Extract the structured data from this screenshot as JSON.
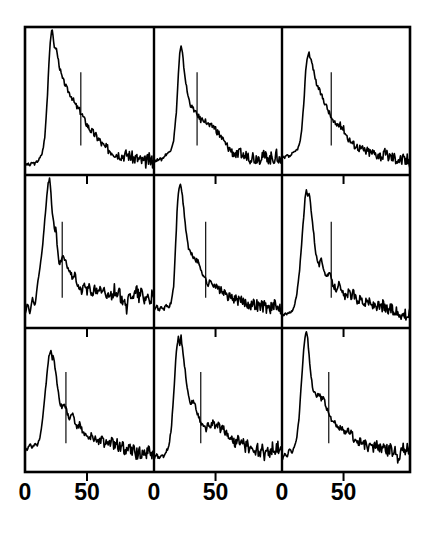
{
  "figure": {
    "title": "",
    "panel_rows": 3,
    "panel_cols": 3,
    "background_color": "#ffffff",
    "line_color": "#000000",
    "frame_color": "#000000",
    "marker_color": "#000000"
  },
  "axis": {
    "x_tick_labels": [
      "0",
      "50"
    ],
    "x_tick_values": [
      0,
      50
    ],
    "x_range": [
      0,
      104
    ],
    "show_y_axis_labels": false,
    "grid": false
  },
  "columns": [
    {
      "tick_labels": [
        "0",
        "50"
      ]
    },
    {
      "tick_labels": [
        "0",
        "50"
      ]
    },
    {
      "tick_labels": [
        "0",
        "50"
      ]
    }
  ],
  "chart_data": {
    "type": "line",
    "title": "",
    "xlabel": "",
    "ylabel": "",
    "xlim": [
      0,
      104
    ],
    "ylim": [
      0,
      1
    ],
    "grid": false,
    "legend": null,
    "layout": {
      "rows": 3,
      "cols": 3,
      "shared_x": true,
      "x_tick_labels": [
        "0",
        "50"
      ],
      "x_ticks": [
        0,
        50
      ]
    },
    "panels": [
      {
        "id": "panel-r1c1",
        "row": 1,
        "col": 1,
        "marker_x": 45,
        "peak_x": 22,
        "peak_y": 1.0,
        "x": [
          0,
          2,
          4,
          6,
          8,
          10,
          12,
          14,
          16,
          18,
          19,
          20,
          21,
          22,
          23,
          24,
          25,
          26,
          27,
          28,
          30,
          32,
          34,
          36,
          38,
          40,
          42,
          44,
          46,
          48,
          50,
          52,
          54,
          56,
          58,
          60,
          62,
          64,
          66,
          68,
          70,
          72,
          74,
          76,
          78,
          80,
          82,
          84,
          86,
          88,
          90,
          92,
          94,
          96,
          98,
          100,
          102,
          104
        ],
        "y": [
          0.04,
          0.05,
          0.04,
          0.06,
          0.05,
          0.07,
          0.09,
          0.13,
          0.24,
          0.52,
          0.72,
          0.88,
          0.97,
          1.0,
          0.93,
          0.86,
          0.88,
          0.83,
          0.78,
          0.73,
          0.66,
          0.62,
          0.58,
          0.55,
          0.52,
          0.48,
          0.45,
          0.43,
          0.4,
          0.36,
          0.33,
          0.3,
          0.28,
          0.26,
          0.24,
          0.22,
          0.19,
          0.17,
          0.16,
          0.15,
          0.14,
          0.13,
          0.12,
          0.12,
          0.11,
          0.11,
          0.12,
          0.11,
          0.1,
          0.09,
          0.09,
          0.08,
          0.07,
          0.06,
          0.07,
          0.08,
          0.07,
          0.07
        ]
      },
      {
        "id": "panel-r1c2",
        "row": 1,
        "col": 2,
        "marker_x": 35,
        "peak_x": 22,
        "peak_y": 0.88,
        "x": [
          0,
          2,
          4,
          6,
          8,
          10,
          12,
          14,
          16,
          18,
          19,
          20,
          21,
          22,
          23,
          24,
          25,
          26,
          27,
          28,
          30,
          32,
          34,
          36,
          38,
          40,
          42,
          44,
          46,
          48,
          50,
          52,
          54,
          56,
          58,
          60,
          62,
          64,
          66,
          68,
          70,
          72,
          74,
          76,
          78,
          80,
          82,
          84,
          86,
          88,
          90,
          92,
          94,
          96,
          98,
          100,
          102,
          104
        ],
        "y": [
          0.08,
          0.07,
          0.09,
          0.08,
          0.1,
          0.12,
          0.13,
          0.16,
          0.22,
          0.4,
          0.55,
          0.72,
          0.84,
          0.88,
          0.84,
          0.76,
          0.68,
          0.62,
          0.56,
          0.52,
          0.46,
          0.44,
          0.41,
          0.39,
          0.36,
          0.37,
          0.35,
          0.33,
          0.31,
          0.32,
          0.3,
          0.27,
          0.25,
          0.22,
          0.19,
          0.17,
          0.15,
          0.13,
          0.12,
          0.11,
          0.13,
          0.11,
          0.1,
          0.12,
          0.09,
          0.11,
          0.08,
          0.1,
          0.09,
          0.12,
          0.09,
          0.11,
          0.08,
          0.1,
          0.09,
          0.11,
          0.07,
          0.09
        ]
      },
      {
        "id": "panel-r1c3",
        "row": 1,
        "col": 3,
        "marker_x": 40,
        "peak_x": 23,
        "peak_y": 0.84,
        "x": [
          0,
          2,
          4,
          6,
          8,
          10,
          12,
          14,
          16,
          18,
          19,
          20,
          21,
          22,
          23,
          24,
          25,
          26,
          27,
          28,
          30,
          32,
          34,
          36,
          38,
          40,
          42,
          44,
          46,
          48,
          50,
          52,
          54,
          56,
          58,
          60,
          62,
          64,
          66,
          68,
          70,
          72,
          74,
          76,
          78,
          80,
          82,
          84,
          86,
          88,
          90,
          92,
          94,
          96,
          98,
          100,
          102,
          104
        ],
        "y": [
          0.1,
          0.09,
          0.11,
          0.1,
          0.12,
          0.13,
          0.15,
          0.18,
          0.28,
          0.52,
          0.68,
          0.78,
          0.82,
          0.84,
          0.8,
          0.78,
          0.74,
          0.7,
          0.66,
          0.62,
          0.58,
          0.54,
          0.5,
          0.46,
          0.42,
          0.38,
          0.34,
          0.33,
          0.33,
          0.32,
          0.3,
          0.26,
          0.23,
          0.21,
          0.19,
          0.18,
          0.17,
          0.16,
          0.15,
          0.14,
          0.14,
          0.13,
          0.13,
          0.12,
          0.12,
          0.11,
          0.11,
          0.12,
          0.11,
          0.1,
          0.1,
          0.09,
          0.09,
          0.08,
          0.08,
          0.07,
          0.08,
          0.07
        ]
      },
      {
        "id": "panel-r2c1",
        "row": 2,
        "col": 1,
        "marker_x": 30,
        "peak_x": 20,
        "peak_y": 1.0,
        "x": [
          0,
          2,
          4,
          6,
          8,
          10,
          12,
          14,
          16,
          18,
          19,
          20,
          21,
          22,
          23,
          24,
          25,
          26,
          27,
          28,
          30,
          32,
          34,
          36,
          38,
          40,
          42,
          44,
          46,
          48,
          50,
          52,
          54,
          56,
          58,
          60,
          62,
          64,
          66,
          68,
          70,
          72,
          74,
          76,
          78,
          80,
          82,
          84,
          86,
          88,
          90,
          92,
          94,
          96,
          98,
          100,
          102,
          104
        ],
        "y": [
          0.06,
          0.14,
          0.07,
          0.18,
          0.12,
          0.26,
          0.38,
          0.52,
          0.72,
          0.92,
          0.98,
          1.0,
          0.88,
          0.76,
          0.72,
          0.62,
          0.66,
          0.52,
          0.44,
          0.4,
          0.46,
          0.44,
          0.4,
          0.36,
          0.32,
          0.34,
          0.28,
          0.24,
          0.22,
          0.28,
          0.22,
          0.26,
          0.2,
          0.24,
          0.22,
          0.25,
          0.2,
          0.23,
          0.18,
          0.22,
          0.19,
          0.24,
          0.17,
          0.22,
          0.15,
          0.2,
          0.1,
          0.18,
          0.21,
          0.19,
          0.23,
          0.18,
          0.22,
          0.16,
          0.2,
          0.17,
          0.19,
          0.16
        ]
      },
      {
        "id": "panel-r2c2",
        "row": 2,
        "col": 2,
        "marker_x": 42,
        "peak_x": 22,
        "peak_y": 0.95,
        "x": [
          0,
          2,
          4,
          6,
          8,
          10,
          12,
          14,
          16,
          18,
          19,
          20,
          21,
          22,
          23,
          24,
          25,
          26,
          27,
          28,
          30,
          32,
          34,
          36,
          38,
          40,
          42,
          44,
          46,
          48,
          50,
          52,
          54,
          56,
          58,
          60,
          62,
          64,
          66,
          68,
          70,
          72,
          74,
          76,
          78,
          80,
          82,
          84,
          86,
          88,
          90,
          92,
          94,
          96,
          98,
          100,
          102,
          104
        ],
        "y": [
          0.1,
          0.13,
          0.09,
          0.12,
          0.1,
          0.13,
          0.11,
          0.15,
          0.26,
          0.62,
          0.82,
          0.92,
          0.95,
          0.94,
          0.88,
          0.8,
          0.72,
          0.64,
          0.58,
          0.52,
          0.48,
          0.46,
          0.44,
          0.42,
          0.38,
          0.34,
          0.3,
          0.27,
          0.29,
          0.28,
          0.26,
          0.24,
          0.23,
          0.22,
          0.2,
          0.19,
          0.18,
          0.18,
          0.17,
          0.16,
          0.16,
          0.15,
          0.15,
          0.14,
          0.14,
          0.13,
          0.14,
          0.13,
          0.12,
          0.13,
          0.12,
          0.11,
          0.12,
          0.11,
          0.12,
          0.11,
          0.12,
          0.11
        ]
      },
      {
        "id": "panel-r2c3",
        "row": 2,
        "col": 3,
        "marker_x": 40,
        "peak_x": 22,
        "peak_y": 0.92,
        "x": [
          0,
          2,
          4,
          6,
          8,
          10,
          12,
          14,
          16,
          18,
          19,
          20,
          21,
          22,
          23,
          24,
          25,
          26,
          27,
          28,
          30,
          32,
          34,
          36,
          38,
          40,
          42,
          44,
          46,
          48,
          50,
          52,
          54,
          56,
          58,
          60,
          62,
          64,
          66,
          68,
          70,
          72,
          74,
          76,
          78,
          80,
          82,
          84,
          86,
          88,
          90,
          92,
          94,
          96,
          98,
          100,
          102,
          104
        ],
        "y": [
          0.05,
          0.07,
          0.06,
          0.09,
          0.08,
          0.12,
          0.2,
          0.34,
          0.56,
          0.78,
          0.88,
          0.92,
          0.86,
          0.9,
          0.84,
          0.76,
          0.68,
          0.6,
          0.52,
          0.46,
          0.4,
          0.44,
          0.38,
          0.32,
          0.36,
          0.3,
          0.26,
          0.24,
          0.28,
          0.22,
          0.2,
          0.18,
          0.22,
          0.19,
          0.21,
          0.17,
          0.16,
          0.18,
          0.15,
          0.14,
          0.16,
          0.13,
          0.12,
          0.14,
          0.12,
          0.11,
          0.13,
          0.1,
          0.09,
          0.11,
          0.08,
          0.1,
          0.07,
          0.09,
          0.06,
          0.08,
          0.06,
          0.07
        ]
      },
      {
        "id": "panel-r3c1",
        "row": 3,
        "col": 1,
        "marker_x": 33,
        "peak_x": 21,
        "peak_y": 0.86,
        "x": [
          0,
          2,
          4,
          6,
          8,
          10,
          12,
          14,
          16,
          18,
          19,
          20,
          21,
          22,
          23,
          24,
          25,
          26,
          27,
          28,
          30,
          32,
          34,
          36,
          38,
          40,
          42,
          44,
          46,
          48,
          50,
          52,
          54,
          56,
          58,
          60,
          62,
          64,
          66,
          68,
          70,
          72,
          74,
          76,
          78,
          80,
          82,
          84,
          86,
          88,
          90,
          92,
          94,
          96,
          98,
          100,
          102,
          104
        ],
        "y": [
          0.16,
          0.13,
          0.18,
          0.14,
          0.19,
          0.16,
          0.22,
          0.34,
          0.52,
          0.72,
          0.8,
          0.84,
          0.86,
          0.8,
          0.82,
          0.74,
          0.68,
          0.6,
          0.54,
          0.48,
          0.44,
          0.46,
          0.4,
          0.36,
          0.4,
          0.34,
          0.3,
          0.32,
          0.28,
          0.25,
          0.23,
          0.21,
          0.24,
          0.2,
          0.22,
          0.19,
          0.21,
          0.18,
          0.2,
          0.17,
          0.19,
          0.16,
          0.18,
          0.15,
          0.17,
          0.14,
          0.12,
          0.15,
          0.11,
          0.13,
          0.1,
          0.12,
          0.11,
          0.13,
          0.1,
          0.12,
          0.11,
          0.12
        ]
      },
      {
        "id": "panel-r3c2",
        "row": 3,
        "col": 2,
        "marker_x": 38,
        "peak_x": 21,
        "peak_y": 0.96,
        "x": [
          0,
          2,
          4,
          6,
          8,
          10,
          12,
          14,
          16,
          18,
          19,
          20,
          21,
          22,
          23,
          24,
          25,
          26,
          27,
          28,
          30,
          32,
          34,
          36,
          38,
          40,
          42,
          44,
          46,
          48,
          50,
          52,
          54,
          56,
          58,
          60,
          62,
          64,
          66,
          68,
          70,
          72,
          74,
          76,
          78,
          80,
          82,
          84,
          86,
          88,
          90,
          92,
          94,
          96,
          98,
          100,
          102,
          104
        ],
        "y": [
          0.06,
          0.1,
          0.07,
          0.09,
          0.08,
          0.12,
          0.16,
          0.28,
          0.54,
          0.84,
          0.92,
          0.96,
          0.9,
          0.96,
          0.88,
          0.8,
          0.74,
          0.66,
          0.58,
          0.52,
          0.46,
          0.5,
          0.44,
          0.38,
          0.34,
          0.3,
          0.28,
          0.32,
          0.3,
          0.34,
          0.3,
          0.32,
          0.28,
          0.3,
          0.26,
          0.24,
          0.22,
          0.2,
          0.18,
          0.22,
          0.16,
          0.2,
          0.14,
          0.18,
          0.12,
          0.16,
          0.1,
          0.15,
          0.09,
          0.14,
          0.08,
          0.16,
          0.07,
          0.15,
          0.09,
          0.17,
          0.1,
          0.14
        ]
      },
      {
        "id": "panel-r3c3",
        "row": 3,
        "col": 3,
        "marker_x": 38,
        "peak_x": 21,
        "peak_y": 1.0,
        "x": [
          0,
          2,
          4,
          6,
          8,
          10,
          12,
          14,
          16,
          18,
          19,
          20,
          21,
          22,
          23,
          24,
          25,
          26,
          27,
          28,
          30,
          32,
          34,
          36,
          38,
          40,
          42,
          44,
          46,
          48,
          50,
          52,
          54,
          56,
          58,
          60,
          62,
          64,
          66,
          68,
          70,
          72,
          74,
          76,
          78,
          80,
          82,
          84,
          86,
          88,
          90,
          92,
          94,
          96,
          98,
          100,
          102,
          104
        ],
        "y": [
          0.06,
          0.1,
          0.08,
          0.14,
          0.11,
          0.16,
          0.22,
          0.38,
          0.66,
          0.9,
          0.98,
          1.0,
          0.94,
          0.82,
          0.72,
          0.64,
          0.58,
          0.54,
          0.56,
          0.52,
          0.54,
          0.5,
          0.52,
          0.44,
          0.4,
          0.36,
          0.34,
          0.3,
          0.28,
          0.3,
          0.26,
          0.24,
          0.28,
          0.26,
          0.22,
          0.2,
          0.18,
          0.2,
          0.16,
          0.18,
          0.14,
          0.17,
          0.13,
          0.18,
          0.14,
          0.16,
          0.13,
          0.15,
          0.12,
          0.14,
          0.11,
          0.13,
          0.08,
          0.12,
          0.14,
          0.13,
          0.15,
          0.14
        ]
      }
    ]
  }
}
